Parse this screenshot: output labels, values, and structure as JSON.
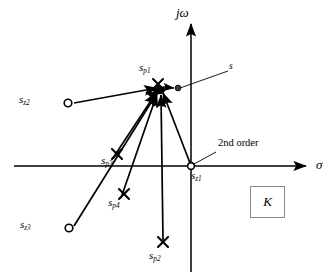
{
  "figure": {
    "background": "#ffffff",
    "stroke": "#000000",
    "marker_zero_fill": "#ffffff",
    "kbox_border": "#8a8a8a"
  },
  "axes": {
    "vertical": {
      "label_j": "j",
      "label_omega": "ω",
      "label": "jω",
      "x": 191,
      "y_top": 18,
      "y_bottom": 272
    },
    "horizontal": {
      "label": "σ",
      "y": 166,
      "x_left": 14,
      "x_right": 313
    }
  },
  "markers": {
    "poles": [
      {
        "name": "s_p1",
        "base": "s",
        "sub": "p1",
        "x": 158,
        "y": 84,
        "label_x": 139,
        "label_y": 66
      },
      {
        "name": "s_p2",
        "base": "s",
        "sub": "p2",
        "x": 163,
        "y": 242,
        "label_x": 150,
        "label_y": 252
      },
      {
        "name": "s_p3",
        "base": "s",
        "sub": "p3",
        "x": 117,
        "y": 154,
        "label_x": 103,
        "label_y": 157
      },
      {
        "name": "s_p4",
        "base": "s",
        "sub": "p4",
        "x": 124,
        "y": 194,
        "label_x": 110,
        "label_y": 199
      }
    ],
    "zeros": [
      {
        "name": "s_z1",
        "base": "s",
        "sub": "z1",
        "x": 191,
        "y": 166,
        "label_x": 193,
        "label_y": 171
      },
      {
        "name": "s_z2",
        "base": "s",
        "sub": "z2",
        "x": 68,
        "y": 103,
        "label_x": 19,
        "label_y": 95
      },
      {
        "name": "s_z3",
        "base": "s",
        "sub": "z3",
        "x": 69,
        "y": 228,
        "label_x": 20,
        "label_y": 220
      }
    ],
    "test_point": {
      "name": "s",
      "base": "s",
      "x": 178,
      "y": 89,
      "label_x": 229,
      "label_y": 68
    },
    "convergence": {
      "x": 160,
      "y": 90
    }
  },
  "annotations": {
    "second_order": {
      "text": "2nd order",
      "x": 219,
      "y": 144,
      "leader_from_x": 216,
      "leader_from_y": 154,
      "leader_to_x": 193,
      "leader_to_y": 164
    },
    "gain_box": {
      "label": "K",
      "x": 250,
      "y": 186,
      "width": 33,
      "height": 30
    }
  },
  "vectors": [
    {
      "from": "s_z2",
      "to": "convergence",
      "kind": "zero-vector"
    },
    {
      "from": "s_z3",
      "to": "convergence",
      "kind": "zero-vector"
    },
    {
      "from": "s_z1",
      "to": "convergence",
      "kind": "zero-vector"
    },
    {
      "from": "s_p1",
      "to": "convergence",
      "kind": "pole-vector"
    },
    {
      "from": "s_p2",
      "to": "convergence",
      "kind": "pole-vector"
    },
    {
      "from": "s_p3",
      "to": "convergence",
      "kind": "pole-vector"
    },
    {
      "from": "s_p4",
      "to": "convergence",
      "kind": "pole-vector"
    },
    {
      "from": "s_p1",
      "to": "test_point",
      "kind": "short-arrow"
    }
  ]
}
